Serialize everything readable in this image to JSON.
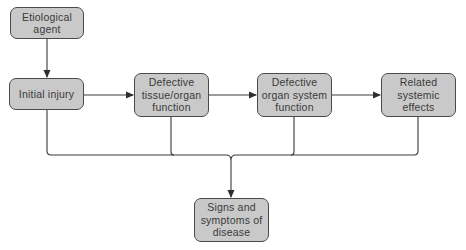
{
  "diagram": {
    "title": "",
    "nodes": [
      {
        "id": "etiological-agent",
        "label": "Etiological\nagent"
      },
      {
        "id": "initial-injury",
        "label": "Initial injury"
      },
      {
        "id": "defective-tissue",
        "label": "Defective\ntissue/organ\nfunction"
      },
      {
        "id": "defective-organ-system",
        "label": "Defective\norgan system\nfunction"
      },
      {
        "id": "related-systemic-effects",
        "label": "Related\nsystemic\neffects"
      },
      {
        "id": "signs-symptoms",
        "label": "Signs and\nsymptoms of\ndisease"
      }
    ],
    "edges": [
      {
        "from": "etiological-agent",
        "to": "initial-injury"
      },
      {
        "from": "initial-injury",
        "to": "defective-tissue"
      },
      {
        "from": "defective-tissue",
        "to": "defective-organ-system"
      },
      {
        "from": "defective-organ-system",
        "to": "related-systemic-effects"
      },
      {
        "from": "initial-injury",
        "to": "signs-symptoms"
      },
      {
        "from": "defective-tissue",
        "to": "signs-symptoms"
      },
      {
        "from": "defective-organ-system",
        "to": "signs-symptoms"
      },
      {
        "from": "related-systemic-effects",
        "to": "signs-symptoms"
      }
    ],
    "colors": {
      "node_fill": "#c9c9c9",
      "node_border": "#4a4a4a",
      "line": "#3a3a3a",
      "text": "#3a3a3a"
    }
  }
}
